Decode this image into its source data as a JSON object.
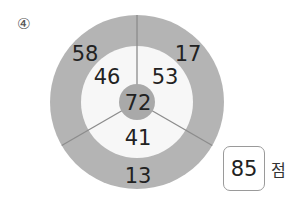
{
  "problem_label": "④",
  "target": {
    "center": [
      137,
      102
    ],
    "outer_radius": 87,
    "inner_radius": 56,
    "center_radius": 18,
    "colors": {
      "outer_ring": "#b4b4b4",
      "inner_ring": "#f7f7f7",
      "center": "#a9a9a9",
      "divider": "#8c8c8c",
      "text": "#222222"
    },
    "center_value": "72",
    "inner_values": {
      "top_left": "46",
      "top_right": "53",
      "bottom": "41"
    },
    "outer_values": {
      "top_left": "58",
      "top_right": "17",
      "bottom": "13"
    }
  },
  "answer": {
    "value": "85",
    "unit": "점"
  }
}
